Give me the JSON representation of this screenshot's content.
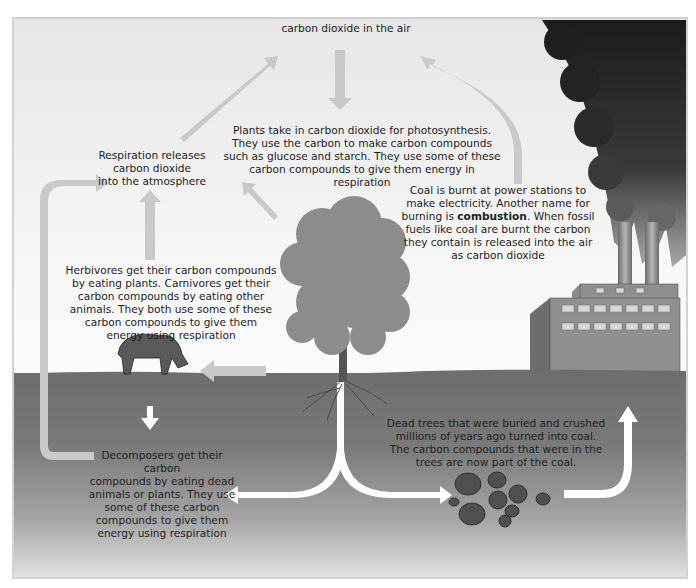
{
  "diagram": {
    "colors": {
      "sky": "#efefef",
      "ground_top": "#6e6e6e",
      "arrow_light": "#c8c8c8",
      "arrow_white": "#ffffff",
      "smoke": "#2b2b2b",
      "text": "#1e1e1e"
    },
    "labels": {
      "co2_air": "carbon dioxide in the air",
      "respiration": "Respiration releases\ncarbon dioxide\ninto the atmosphere",
      "photosynthesis": "Plants take in carbon dioxide for photosynthesis.\nThey use the carbon to make carbon compounds\nsuch as glucose and starch. They use some of these\ncarbon compounds to give them energy in respiration",
      "combustion_before": "Coal is burnt at power stations to\nmake electricity. Another name for\nburning is ",
      "combustion_bold": "combustion",
      "combustion_after": ". When fossil\nfuels like coal are burnt the carbon\nthey contain is released into the air\nas carbon dioxide",
      "herbivores": "Herbivores get their carbon compounds\nby eating plants. Carnivores get their\ncarbon compounds by eating other\nanimals. They both use some of these\ncarbon compounds to give them\nenergy using respiration",
      "decomposers": "Decomposers get their carbon\ncompounds by eating dead\nanimals or plants. They use\nsome of these carbon\ncompounds to give them\nenergy using respiration",
      "fossil": "Dead trees that were buried and crushed\nmillions of years ago turned into coal.\nThe carbon compounds that were in the\ntrees are now part of the coal."
    },
    "nodes": [
      {
        "id": "air",
        "name": "carbon dioxide in the air"
      },
      {
        "id": "plants",
        "name": "tree"
      },
      {
        "id": "animals",
        "name": "cow"
      },
      {
        "id": "decomposers",
        "name": "decomposers"
      },
      {
        "id": "coal",
        "name": "coal"
      },
      {
        "id": "power-station",
        "name": "power station"
      }
    ],
    "edges": [
      {
        "from": "air",
        "to": "plants",
        "label": "photosynthesis"
      },
      {
        "from": "plants",
        "to": "air",
        "label": "respiration"
      },
      {
        "from": "plants",
        "to": "animals",
        "label": "eating"
      },
      {
        "from": "animals",
        "to": "air",
        "label": "respiration"
      },
      {
        "from": "animals",
        "to": "decomposers",
        "label": "death"
      },
      {
        "from": "plants",
        "to": "decomposers",
        "label": "death"
      },
      {
        "from": "decomposers",
        "to": "air",
        "label": "respiration"
      },
      {
        "from": "plants",
        "to": "coal",
        "label": "fossilisation"
      },
      {
        "from": "coal",
        "to": "power-station",
        "label": "mining"
      },
      {
        "from": "power-station",
        "to": "air",
        "label": "combustion"
      }
    ]
  }
}
